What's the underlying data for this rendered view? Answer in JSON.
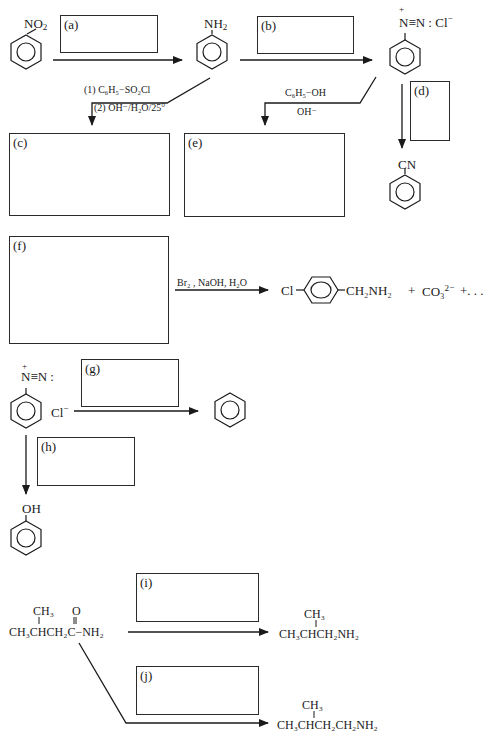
{
  "boxes": {
    "a": {
      "label": "(a)"
    },
    "b": {
      "label": "(b)"
    },
    "c": {
      "label": "(c)"
    },
    "d": {
      "label": "(d)"
    },
    "e": {
      "label": "(e)"
    },
    "f": {
      "label": "(f)"
    },
    "g": {
      "label": "(g)"
    },
    "h": {
      "label": "(h)"
    },
    "i": {
      "label": "(i)"
    },
    "j": {
      "label": "(j)"
    }
  },
  "compounds": {
    "nitrobenzene_sub": "NO",
    "nitrobenzene_sub2": "2",
    "aniline_sub": "NH",
    "aniline_sub2": "2",
    "diazonium_sub": "N≡N : Cl",
    "diazonium_minus": "−",
    "diazonium_plus": "+",
    "benzonitrile_sub": "CN",
    "chloro_prefix": "Cl",
    "chloro_product_suffix": "CH₂NH₂",
    "chloro_plus1": "+",
    "carbonate": "CO₃",
    "carbonate_charge": "2−",
    "chloro_ellipsis": "+. . .",
    "diazo2_top": "N≡N :",
    "diazo2_plus": "+",
    "diazo2_cl": "Cl",
    "diazo2_cl_minus": "−",
    "phenol_sub": "OH",
    "amide_ch3": "CH₃",
    "amide_o": "O",
    "amide_main": "CH₃CHCH₂C−NH₂",
    "amine1_ch3": "CH₃",
    "amine1_main": "CH₃CHCH₂NH₂",
    "amine2_ch3": "CH₃",
    "amine2_main": "CH₃CHCH₂CH₂NH₂"
  },
  "reagents": {
    "c_step1": "(1) C₆H₅−SO₂Cl",
    "c_step2": "(2) OH⁻/H₂O/25°",
    "e_reagent1": "C₆H₅−OH",
    "e_reagent2": "OH⁻",
    "f_reagent": "Br₂ , NaOH, H₂O"
  }
}
